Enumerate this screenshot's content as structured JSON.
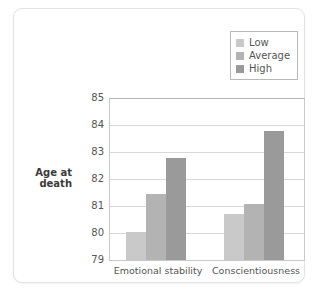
{
  "chart_data": {
    "type": "bar",
    "title": "",
    "subtitle": "",
    "xlabel": "",
    "ylabel": "Age at death",
    "ylabel_lines": [
      "Age at",
      "death"
    ],
    "categories": [
      "Emotional stability",
      "Conscientiousness"
    ],
    "series": [
      {
        "name": "Low",
        "values": [
          80.05,
          80.7
        ],
        "color": "#c9c9c9"
      },
      {
        "name": "Average",
        "values": [
          81.45,
          81.1
        ],
        "color": "#b3b3b3"
      },
      {
        "name": "High",
        "values": [
          82.8,
          83.8
        ],
        "color": "#9a9a9a"
      }
    ],
    "ylim": [
      79,
      85
    ],
    "yticks": [
      "85",
      "84",
      "83",
      "82",
      "81",
      "80",
      "79"
    ],
    "grid": true,
    "legend_position": "top-right",
    "legend_entries": [
      "Low",
      "Average",
      "High"
    ]
  },
  "colors": {
    "card_background": "#ffffff",
    "card_border": "#e3e3e3",
    "plot_border": "#c9c9c9",
    "gridline": "#d8d8d8",
    "text": "#555555",
    "axis_title_text": "#3a3a3a",
    "legend_border": "#b9b9b9"
  }
}
